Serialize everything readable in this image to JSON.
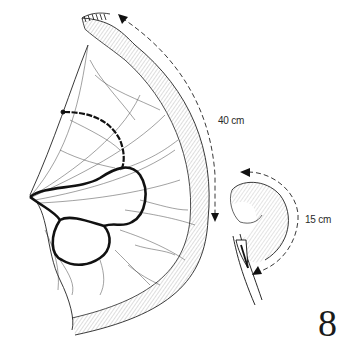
{
  "figure": {
    "number": "8"
  },
  "annotations": {
    "length_proximal": "40 cm",
    "length_distal": "15 cm"
  },
  "elements": {
    "bowel_main": "small-intestine-loop",
    "mesentery": "mesentery-fan",
    "vascular_arcades": "vessel-arcade-loops",
    "bowel_distal": "distal-bowel-segment",
    "instrument": "surgical-clamp",
    "stapled_end": "stapled-bowel-end"
  },
  "colors": {
    "ink": "#1a1a1a",
    "background": "#ffffff",
    "label": "#2a2a2a"
  }
}
